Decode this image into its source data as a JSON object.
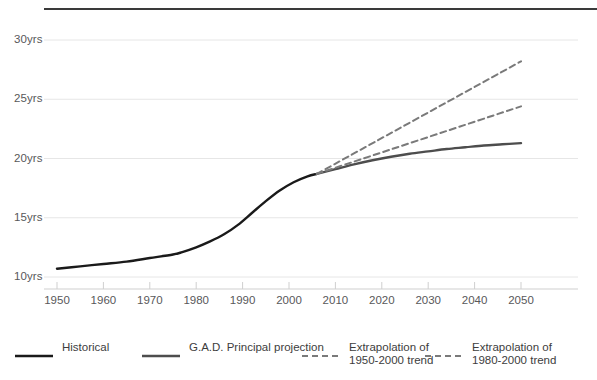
{
  "chart_data": {
    "type": "line",
    "title": "",
    "xlabel": "",
    "ylabel": "",
    "xlim": [
      1950,
      2050
    ],
    "ylim": [
      10,
      30
    ],
    "grid": true,
    "y_tick_labels": [
      "30yrs",
      "25yrs",
      "20yrs",
      "15yrs",
      "10yrs"
    ],
    "y_tick_values": [
      30,
      25,
      20,
      15,
      10
    ],
    "x_tick_labels": [
      "1950",
      "1960",
      "1970",
      "1980",
      "1990",
      "2000",
      "2010",
      "2020",
      "2030",
      "2040",
      "2050"
    ],
    "x_tick_values": [
      1950,
      1960,
      1970,
      1980,
      1990,
      2000,
      2010,
      2020,
      2030,
      2040,
      2050
    ],
    "legend_position": "bottom",
    "series": [
      {
        "name": "Historical",
        "style": "solid",
        "color": "#1a1a1a",
        "width": 2.4,
        "x": [
          1950,
          1955,
          1960,
          1965,
          1970,
          1975,
          1977,
          1980,
          1983,
          1986,
          1989,
          1992,
          1995,
          1998,
          2001,
          2004,
          2006
        ],
        "y": [
          10.7,
          10.9,
          11.1,
          11.3,
          11.6,
          11.9,
          12.1,
          12.5,
          13.0,
          13.6,
          14.4,
          15.4,
          16.4,
          17.3,
          18.0,
          18.5,
          18.7
        ]
      },
      {
        "name": "G.A.D. Principal projection",
        "style": "solid",
        "color": "#4d4d4d",
        "width": 2.4,
        "x": [
          2006,
          2010,
          2014,
          2018,
          2022,
          2026,
          2030,
          2034,
          2038,
          2042,
          2046,
          2050
        ],
        "y": [
          18.7,
          19.1,
          19.5,
          19.85,
          20.15,
          20.4,
          20.6,
          20.8,
          20.95,
          21.1,
          21.2,
          21.3
        ]
      },
      {
        "name": "Extrapolation of 1950-2000 trend",
        "style": "dashed",
        "color": "#7a7a7a",
        "width": 2.0,
        "x": [
          2006,
          2050
        ],
        "y": [
          18.7,
          24.4
        ]
      },
      {
        "name": "Extrapolation of 1980-2000 trend",
        "style": "dashed",
        "color": "#7a7a7a",
        "width": 2.0,
        "x": [
          2006,
          2050
        ],
        "y": [
          18.7,
          28.2
        ]
      }
    ]
  },
  "legend": [
    {
      "label": "Historical",
      "label2": "",
      "style": "solid",
      "color": "#1a1a1a"
    },
    {
      "label": "G.A.D. Principal projection",
      "label2": "",
      "style": "solid",
      "color": "#4d4d4d"
    },
    {
      "label": "Extrapolation of",
      "label2": "1950-2000 trend",
      "style": "dashed",
      "color": "#7a7a7a"
    },
    {
      "label": "Extrapolation of",
      "label2": "1980-2000 trend",
      "style": "dashed",
      "color": "#7a7a7a"
    }
  ],
  "colors": {
    "grid": "#e6e6e6",
    "axis": "#cfcfcf",
    "tick_text": "#58585a",
    "top_rule": "#3a3a3a"
  }
}
